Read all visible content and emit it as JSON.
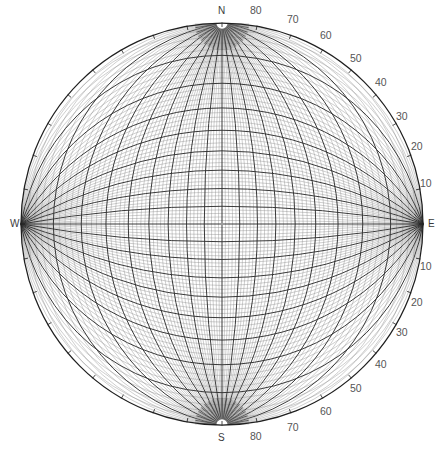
{
  "figure": {
    "type": "wulff-stereonet",
    "projection": "equal-angle stereographic",
    "hemisphere": "lower",
    "width": 443,
    "height": 451,
    "center": {
      "x": 222,
      "y": 224
    },
    "radius": 201,
    "grid_interval_deg": 2,
    "heavy_grid_interval_deg": 10,
    "background_color": "#ffffff",
    "fine_line_color": "#8c8c8c",
    "heavy_line_color": "#2f2f2f",
    "rim_line_color": "#1f1f1f",
    "label_color": "#4a4a4a"
  },
  "cardinals": [
    {
      "name": "north",
      "text": "N",
      "x": 218,
      "y": 6
    },
    {
      "name": "east",
      "text": "E",
      "x": 428,
      "y": 219
    },
    {
      "name": "south",
      "text": "S",
      "x": 218,
      "y": 433
    },
    {
      "name": "west",
      "text": "W",
      "x": 10,
      "y": 219
    }
  ],
  "degree_labels": [
    {
      "text": "80",
      "bearing_deg": 10,
      "x": 250,
      "y": 5
    },
    {
      "text": "70",
      "bearing_deg": 20,
      "x": 287,
      "y": 14
    },
    {
      "text": "60",
      "bearing_deg": 30,
      "x": 320,
      "y": 30
    },
    {
      "text": "50",
      "bearing_deg": 40,
      "x": 350,
      "y": 53
    },
    {
      "text": "40",
      "bearing_deg": 50,
      "x": 375,
      "y": 77
    },
    {
      "text": "30",
      "bearing_deg": 60,
      "x": 396,
      "y": 111
    },
    {
      "text": "20",
      "bearing_deg": 70,
      "x": 411,
      "y": 141
    },
    {
      "text": "10",
      "bearing_deg": 80,
      "x": 420,
      "y": 178
    },
    {
      "text": "10",
      "bearing_deg": 100,
      "x": 420,
      "y": 261
    },
    {
      "text": "20",
      "bearing_deg": 110,
      "x": 411,
      "y": 297
    },
    {
      "text": "30",
      "bearing_deg": 120,
      "x": 396,
      "y": 327
    },
    {
      "text": "40",
      "bearing_deg": 130,
      "x": 375,
      "y": 359
    },
    {
      "text": "50",
      "bearing_deg": 140,
      "x": 350,
      "y": 383
    },
    {
      "text": "60",
      "bearing_deg": 150,
      "x": 320,
      "y": 406
    },
    {
      "text": "70",
      "bearing_deg": 160,
      "x": 287,
      "y": 422
    },
    {
      "text": "80",
      "bearing_deg": 170,
      "x": 250,
      "y": 431
    }
  ],
  "chart_data": {
    "type": "scatter",
    "title": "",
    "xlabel": "",
    "ylabel": "",
    "grid": true,
    "legend": "none",
    "great_circles_dip_deg": [
      2,
      4,
      6,
      8,
      10,
      12,
      14,
      16,
      18,
      20,
      22,
      24,
      26,
      28,
      30,
      32,
      34,
      36,
      38,
      40,
      42,
      44,
      46,
      48,
      50,
      52,
      54,
      56,
      58,
      60,
      62,
      64,
      66,
      68,
      70,
      72,
      74,
      76,
      78,
      80,
      82,
      84,
      86,
      88
    ],
    "small_circles_angle_deg": [
      2,
      4,
      6,
      8,
      10,
      12,
      14,
      16,
      18,
      20,
      22,
      24,
      26,
      28,
      30,
      32,
      34,
      36,
      38,
      40,
      42,
      44,
      46,
      48,
      50,
      52,
      54,
      56,
      58,
      60,
      62,
      64,
      66,
      68,
      70,
      72,
      74,
      76,
      78,
      80,
      82,
      84,
      86,
      88
    ],
    "heavy_values_deg": [
      10,
      20,
      30,
      40,
      50,
      60,
      70,
      80
    ],
    "rim_ticks_deg": [
      10,
      20,
      30,
      40,
      50,
      60,
      70,
      80
    ]
  }
}
